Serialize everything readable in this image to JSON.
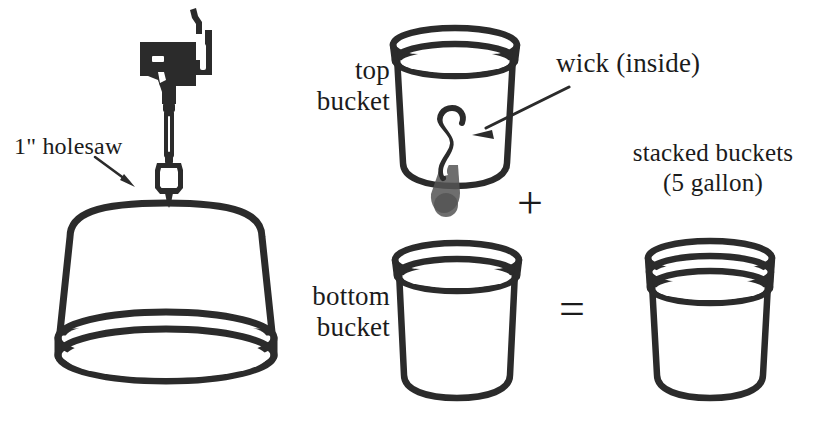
{
  "figure": {
    "background_color": "#ffffff",
    "ink_color": "#2b2b2b",
    "width": 823,
    "height": 425
  },
  "labels": {
    "holesaw": "1\" holesaw",
    "top_bucket": "top bucket",
    "wick": "wick (inside)",
    "stacked_line1": "stacked buckets",
    "stacked_line2": "(5 gallon)",
    "bottom_bucket": "bottom bucket"
  },
  "operators": {
    "plus": "+",
    "equals": "="
  },
  "parts": [
    {
      "name": "cordless-drill",
      "description": "cordless drill held vertically, bit pointing down"
    },
    {
      "name": "holesaw-bit",
      "description": "1 inch holesaw cutting bit attached to drill chuck"
    },
    {
      "name": "inverted-bucket",
      "description": "five gallon bucket shown upside down, rim at bottom, being drilled"
    },
    {
      "name": "top-bucket",
      "description": "upright bucket containing an S-shaped wick passing through a hole in its base"
    },
    {
      "name": "wick",
      "description": "rope wick inside the top bucket, hanging through the bottom hole"
    },
    {
      "name": "bottom-bucket",
      "description": "upright empty five gallon bucket"
    },
    {
      "name": "stacked-buckets",
      "description": "top bucket nested inside bottom bucket, double rim visible"
    }
  ]
}
